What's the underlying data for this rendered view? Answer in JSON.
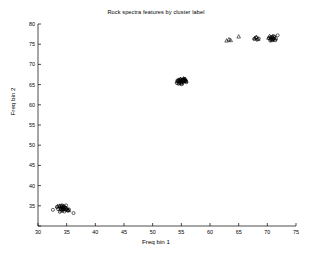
{
  "chart_data": {
    "type": "scatter",
    "title": "Rock spectra features by cluster label",
    "xlabel": "Freq bin 1",
    "ylabel": "Freq bin 2",
    "xlim": [
      30,
      75
    ],
    "ylim": [
      30,
      80
    ],
    "xticks": [
      30,
      35,
      40,
      45,
      50,
      55,
      60,
      65,
      70,
      75
    ],
    "yticks": [
      30,
      35,
      40,
      45,
      50,
      55,
      60,
      65,
      70,
      75,
      80
    ],
    "grid": false,
    "legend": "none",
    "marker_color": "#000000",
    "series": [
      {
        "name": "cluster 0",
        "marker": "circle",
        "points": [
          [
            32.6,
            34.0
          ],
          [
            33.3,
            34.7
          ],
          [
            33.5,
            34.2
          ],
          [
            33.7,
            34.9
          ],
          [
            33.9,
            34.4
          ],
          [
            34.0,
            35.0
          ],
          [
            34.1,
            34.1
          ],
          [
            34.2,
            34.6
          ],
          [
            34.3,
            33.9
          ],
          [
            34.4,
            34.8
          ],
          [
            34.5,
            34.3
          ],
          [
            34.6,
            33.6
          ],
          [
            34.7,
            34.5
          ],
          [
            34.8,
            34.0
          ],
          [
            35.0,
            34.2
          ],
          [
            35.2,
            33.8
          ],
          [
            35.4,
            34.1
          ],
          [
            36.2,
            33.2
          ],
          [
            33.8,
            33.5
          ],
          [
            34.9,
            35.1
          ]
        ]
      },
      {
        "name": "cluster 0 alt",
        "marker": "triangle",
        "points": [
          [
            33.4,
            34.9
          ],
          [
            33.8,
            35.0
          ],
          [
            34.0,
            34.6
          ],
          [
            34.2,
            35.1
          ],
          [
            34.4,
            34.7
          ],
          [
            34.5,
            35.0
          ],
          [
            34.6,
            34.2
          ],
          [
            34.8,
            34.6
          ],
          [
            35.0,
            34.4
          ],
          [
            35.2,
            34.0
          ],
          [
            35.4,
            33.9
          ],
          [
            34.1,
            33.8
          ],
          [
            34.3,
            34.3
          ],
          [
            33.9,
            34.2
          ]
        ]
      },
      {
        "name": "cluster 1",
        "marker": "circle",
        "points": [
          [
            54.2,
            65.4
          ],
          [
            54.4,
            65.8
          ],
          [
            54.6,
            66.1
          ],
          [
            54.7,
            65.6
          ],
          [
            54.8,
            66.3
          ],
          [
            54.9,
            65.9
          ],
          [
            55.0,
            66.0
          ],
          [
            55.1,
            65.5
          ],
          [
            55.2,
            66.2
          ],
          [
            55.3,
            65.7
          ],
          [
            55.4,
            66.1
          ],
          [
            55.5,
            65.8
          ],
          [
            55.6,
            66.3
          ],
          [
            55.7,
            65.9
          ],
          [
            55.8,
            66.0
          ],
          [
            55.9,
            65.6
          ],
          [
            54.5,
            65.2
          ],
          [
            55.0,
            65.1
          ],
          [
            55.5,
            66.4
          ],
          [
            54.3,
            66.0
          ]
        ]
      },
      {
        "name": "cluster 1 alt",
        "marker": "triangle",
        "points": [
          [
            54.3,
            65.9
          ],
          [
            54.5,
            66.2
          ],
          [
            54.7,
            65.8
          ],
          [
            54.9,
            66.4
          ],
          [
            55.0,
            65.7
          ],
          [
            55.2,
            66.0
          ],
          [
            55.3,
            66.3
          ],
          [
            55.5,
            65.9
          ],
          [
            55.6,
            66.2
          ],
          [
            55.8,
            65.8
          ],
          [
            54.6,
            65.4
          ],
          [
            55.1,
            65.3
          ],
          [
            55.4,
            66.5
          ],
          [
            54.8,
            66.1
          ],
          [
            55.7,
            66.3
          ]
        ]
      },
      {
        "name": "cluster 2",
        "marker": "circle",
        "points": [
          [
            67.7,
            76.3
          ],
          [
            68.0,
            76.6
          ],
          [
            68.2,
            76.1
          ],
          [
            68.5,
            76.4
          ],
          [
            70.3,
            76.5
          ],
          [
            70.6,
            76.2
          ],
          [
            70.8,
            76.7
          ],
          [
            71.0,
            76.3
          ],
          [
            71.2,
            76.8
          ],
          [
            71.4,
            76.0
          ],
          [
            71.8,
            77.2
          ],
          [
            70.5,
            75.9
          ],
          [
            71.1,
            77.0
          ],
          [
            70.9,
            76.1
          ]
        ]
      },
      {
        "name": "cluster 2 alt",
        "marker": "triangle",
        "points": [
          [
            62.9,
            75.9
          ],
          [
            63.3,
            76.2
          ],
          [
            63.6,
            76.0
          ],
          [
            65.0,
            76.9
          ],
          [
            67.8,
            76.5
          ],
          [
            68.1,
            76.8
          ],
          [
            68.4,
            76.3
          ],
          [
            70.2,
            76.6
          ],
          [
            70.4,
            77.0
          ],
          [
            70.7,
            76.4
          ],
          [
            70.9,
            76.9
          ],
          [
            71.1,
            76.5
          ],
          [
            71.3,
            76.2
          ],
          [
            70.6,
            76.8
          ],
          [
            71.5,
            76.6
          ],
          [
            70.8,
            76.0
          ]
        ]
      }
    ]
  }
}
